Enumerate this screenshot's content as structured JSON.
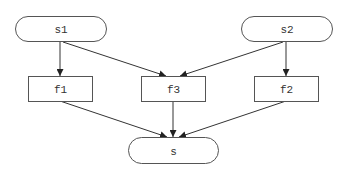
{
  "diagram": {
    "type": "flowchart",
    "colors": {
      "background": "#ffffff",
      "stroke": "#555555",
      "edge": "#333333",
      "text": "#333333"
    },
    "nodes": [
      {
        "id": "s1",
        "label": "s1",
        "shape": "terminal"
      },
      {
        "id": "s2",
        "label": "s2",
        "shape": "terminal"
      },
      {
        "id": "f1",
        "label": "f1",
        "shape": "process"
      },
      {
        "id": "f3",
        "label": "f3",
        "shape": "process"
      },
      {
        "id": "f2",
        "label": "f2",
        "shape": "process"
      },
      {
        "id": "s",
        "label": "s",
        "shape": "terminal"
      }
    ],
    "edges": [
      {
        "from": "s1",
        "to": "f1"
      },
      {
        "from": "s1",
        "to": "f3"
      },
      {
        "from": "s2",
        "to": "f3"
      },
      {
        "from": "s2",
        "to": "f2"
      },
      {
        "from": "f1",
        "to": "s"
      },
      {
        "from": "f3",
        "to": "s"
      },
      {
        "from": "f2",
        "to": "s"
      }
    ]
  }
}
